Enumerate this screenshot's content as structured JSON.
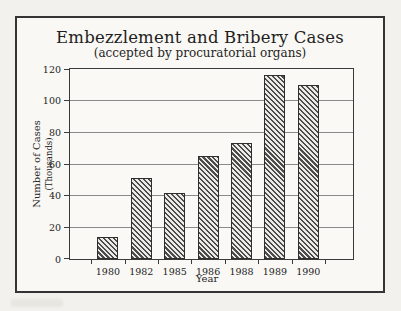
{
  "chart_data": {
    "type": "bar",
    "title": "Embezzlement and Bribery Cases",
    "subtitle": "(accepted by procuratorial organs)",
    "categories": [
      "1980",
      "1982",
      "1985",
      "1986",
      "1988",
      "1989",
      "1990"
    ],
    "values": [
      14,
      51,
      42,
      65,
      73,
      116,
      110
    ],
    "xlabel": "Year",
    "ylabel": "Number of Cases",
    "ylabel_sub": "(Thousands)",
    "ylim": [
      0,
      120
    ],
    "yticks": [
      0,
      20,
      40,
      60,
      80,
      100,
      120
    ],
    "grid": true,
    "legend": "none",
    "bar_style": {
      "fill": "diagonal-hatch",
      "hatch_color": "#4c4c4c",
      "bar_background": "#eceae5",
      "border_color": "#2e2e2e"
    },
    "frame_color": "#343434",
    "gridline_color": "#8a8a8a",
    "paper_color": "#f9f8f4"
  }
}
